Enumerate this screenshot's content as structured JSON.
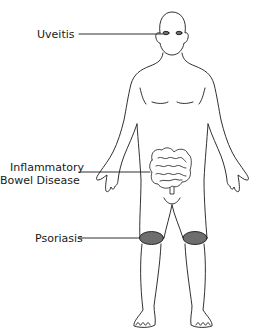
{
  "diagram": {
    "type": "anatomical-body-map",
    "labels": [
      {
        "id": "uveitis",
        "text": "Uveitis",
        "target": "eyes"
      },
      {
        "id": "ibd",
        "line1": "Inflammatory",
        "line2": "Bowel Disease",
        "target": "intestines"
      },
      {
        "id": "psoriasis",
        "text": "Psoriasis",
        "target": "knees"
      }
    ],
    "colors": {
      "outline": "#1a1a1a",
      "highlight": "#6e6e6e",
      "background": "#ffffff"
    }
  }
}
